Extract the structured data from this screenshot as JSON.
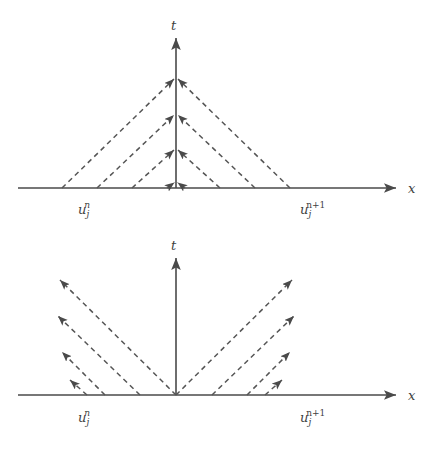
{
  "figure": {
    "title": "",
    "background_color": "#ffffff",
    "line_color": "#555555",
    "axis_color": "#4a4a4a",
    "text_color": "#3f3f3f",
    "width": 431,
    "height": 457
  },
  "panels": [
    {
      "id": "upper-panel",
      "name": "converging-characteristics-diagram",
      "description": "Dashed characteristic lines converging onto the t axis",
      "axes": {
        "x_axis_label": "x",
        "t_axis_label": "t",
        "origin": {
          "x": 176,
          "y": 188
        },
        "x_axis_start": 18,
        "x_axis_end": 400,
        "t_axis_top": 32
      },
      "labels": [
        {
          "name": "left-node-label",
          "base": "u",
          "sub": "j",
          "sup": "n",
          "x": 78,
          "y": 212
        },
        {
          "name": "right-node-label",
          "base": "u",
          "sub": "j",
          "sup": "n+1",
          "x": 300,
          "y": 212
        }
      ],
      "rays": [
        {
          "start_x": 62,
          "start_y": 188,
          "end_x": 176,
          "end_y": 77
        },
        {
          "start_x": 97,
          "start_y": 188,
          "end_x": 176,
          "end_y": 113
        },
        {
          "start_x": 132,
          "start_y": 188,
          "end_x": 176,
          "end_y": 148
        },
        {
          "start_x": 167,
          "start_y": 188,
          "end_x": 176,
          "end_y": 181
        },
        {
          "start_x": 290,
          "start_y": 188,
          "end_x": 176,
          "end_y": 77
        },
        {
          "start_x": 255,
          "start_y": 188,
          "end_x": 176,
          "end_y": 113
        },
        {
          "start_x": 220,
          "start_y": 188,
          "end_x": 176,
          "end_y": 148
        },
        {
          "start_x": 185,
          "start_y": 188,
          "end_x": 176,
          "end_y": 181
        }
      ]
    },
    {
      "id": "lower-panel",
      "name": "diverging-characteristics-diagram",
      "description": "Dashed characteristic lines diverging away from the origin",
      "axes": {
        "x_axis_label": "x",
        "t_axis_label": "t",
        "origin": {
          "x": 176,
          "y": 165
        },
        "x_axis_start": 18,
        "x_axis_end": 400,
        "t_axis_top": 22
      },
      "labels": [
        {
          "name": "left-node-label",
          "base": "u",
          "sub": "j",
          "sup": "n",
          "x": 78,
          "y": 190
        },
        {
          "name": "right-node-label",
          "base": "u",
          "sub": "j",
          "sup": "n+1",
          "x": 300,
          "y": 190
        }
      ],
      "rays": [
        {
          "start_x": 176,
          "start_y": 165,
          "end_x": 60,
          "end_y": 50
        },
        {
          "start_x": 140,
          "start_y": 165,
          "end_x": 58,
          "end_y": 86
        },
        {
          "start_x": 105,
          "start_y": 165,
          "end_x": 62,
          "end_y": 122
        },
        {
          "start_x": 87,
          "start_y": 165,
          "end_x": 70,
          "end_y": 152
        },
        {
          "start_x": 176,
          "start_y": 165,
          "end_x": 292,
          "end_y": 50
        },
        {
          "start_x": 212,
          "start_y": 165,
          "end_x": 294,
          "end_y": 86
        },
        {
          "start_x": 247,
          "start_y": 165,
          "end_x": 290,
          "end_y": 122
        },
        {
          "start_x": 265,
          "start_y": 165,
          "end_x": 282,
          "end_y": 152
        }
      ]
    }
  ]
}
